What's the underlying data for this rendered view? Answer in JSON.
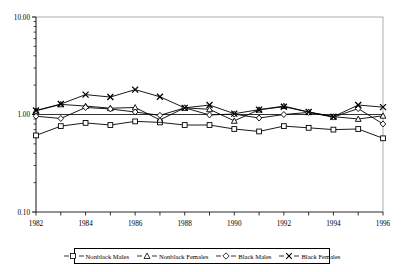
{
  "chart_data": {
    "type": "line",
    "title": "",
    "subtitle": "",
    "xlabel": "",
    "ylabel": "",
    "yscale": "log",
    "ylim": [
      0.1,
      10.0
    ],
    "xlim": [
      1982,
      1996
    ],
    "grid": false,
    "reference_line": 1.0,
    "legend_position": "bottom",
    "y_ticks": [
      "10.00",
      "1.00",
      "0.10"
    ],
    "y_tick_values": [
      10.0,
      1.0,
      0.1
    ],
    "x_ticks": [
      "1982",
      "1984",
      "1986",
      "1988",
      "1990",
      "1992",
      "1994",
      "1996"
    ],
    "x_tick_values": [
      1982,
      1984,
      1986,
      1988,
      1990,
      1992,
      1994,
      1996
    ],
    "x": [
      1982,
      1983,
      1984,
      1985,
      1986,
      1987,
      1988,
      1989,
      1990,
      1991,
      1992,
      1993,
      1994,
      1995,
      1996
    ],
    "series": [
      {
        "name": "Nonblack Males",
        "marker": "square",
        "color": "#000000",
        "values": [
          0.61,
          0.76,
          0.82,
          0.78,
          0.85,
          0.83,
          0.78,
          0.78,
          0.71,
          0.67,
          0.76,
          0.73,
          0.7,
          0.71,
          0.57
        ]
      },
      {
        "name": "Nonblack Females",
        "marker": "triangle",
        "color": "#000000",
        "values": [
          1.09,
          1.27,
          1.22,
          1.16,
          1.18,
          0.88,
          1.17,
          1.13,
          0.86,
          1.12,
          1.22,
          1.06,
          0.95,
          0.9,
          0.97
        ]
      },
      {
        "name": "Black Males",
        "marker": "diamond",
        "color": "#000000",
        "values": [
          0.96,
          0.91,
          1.18,
          1.14,
          1.06,
          0.98,
          1.17,
          0.99,
          1.01,
          0.92,
          1.0,
          1.05,
          0.94,
          1.15,
          0.8
        ]
      },
      {
        "name": "Black Females",
        "marker": "cross",
        "color": "#000000",
        "values": [
          1.1,
          1.28,
          1.6,
          1.51,
          1.8,
          1.52,
          1.17,
          1.25,
          1.02,
          1.12,
          1.2,
          1.06,
          0.95,
          1.25,
          1.19
        ]
      }
    ]
  },
  "legend": {
    "items": [
      {
        "label": "Nonblack Males",
        "marker": "square"
      },
      {
        "label": "Nonblack Females",
        "marker": "triangle"
      },
      {
        "label": "Black Males",
        "marker": "diamond"
      },
      {
        "label": "Black Females",
        "marker": "cross"
      }
    ]
  }
}
